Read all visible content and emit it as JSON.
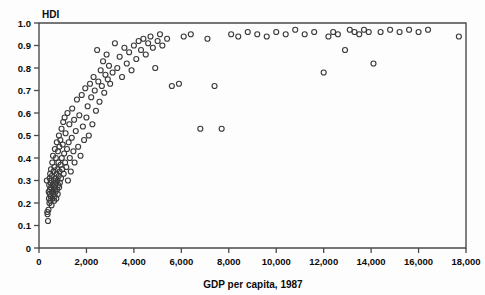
{
  "chart_data": {
    "type": "scatter",
    "title": "",
    "xlabel": "GDP per capita, 1987",
    "ylabel": "HDI",
    "xlim": [
      0,
      18000
    ],
    "ylim": [
      0,
      1.0
    ],
    "grid": false,
    "legend": null,
    "marker": "open-circle",
    "marker_color": "#3a3a3a",
    "xticks": [
      0,
      2000,
      4000,
      6000,
      8000,
      10000,
      12000,
      14000,
      16000,
      18000
    ],
    "xticklabels": [
      "0",
      "2,000",
      "4,000",
      "6,000",
      "8,000",
      "10,000",
      "12,000",
      "14,000",
      "16,000",
      "18,000"
    ],
    "yticks": [
      0,
      0.1,
      0.2,
      0.3,
      0.4,
      0.5,
      0.6,
      0.7,
      0.8,
      0.9,
      1.0
    ],
    "yticklabels": [
      "0",
      "0.1",
      "0.2",
      "0.3",
      "0.4",
      "0.5",
      "0.6",
      "0.7",
      "0.8",
      "0.9",
      "1.0"
    ],
    "series": [
      {
        "name": "countries",
        "x": [
          330,
          350,
          360,
          380,
          400,
          410,
          420,
          430,
          440,
          450,
          455,
          460,
          470,
          480,
          490,
          500,
          505,
          510,
          520,
          530,
          540,
          550,
          560,
          570,
          580,
          590,
          600,
          610,
          620,
          630,
          640,
          650,
          660,
          670,
          680,
          690,
          700,
          710,
          720,
          730,
          740,
          750,
          760,
          770,
          780,
          790,
          800,
          810,
          820,
          830,
          840,
          850,
          860,
          870,
          880,
          900,
          910,
          930,
          950,
          960,
          980,
          1000,
          1020,
          1040,
          1060,
          1080,
          1100,
          1120,
          1150,
          1180,
          1200,
          1220,
          1250,
          1280,
          1300,
          1340,
          1380,
          1400,
          1450,
          1480,
          1500,
          1550,
          1600,
          1650,
          1700,
          1750,
          1800,
          1850,
          1900,
          1950,
          2000,
          2050,
          2100,
          2150,
          2200,
          2250,
          2300,
          2350,
          2400,
          2450,
          2500,
          2550,
          2600,
          2650,
          2700,
          2750,
          2800,
          2850,
          2900,
          2950,
          3000,
          3100,
          3200,
          3300,
          3400,
          3500,
          3600,
          3700,
          3800,
          3900,
          4000,
          4100,
          4200,
          4300,
          4400,
          4500,
          4600,
          4700,
          4800,
          4900,
          5000,
          5100,
          5200,
          5400,
          5600,
          5900,
          6100,
          6400,
          6800,
          7100,
          7400,
          7700,
          8100,
          8400,
          8800,
          9200,
          9600,
          10000,
          10400,
          10800,
          11200,
          11600,
          12000,
          12200,
          12400,
          12600,
          12900,
          13100,
          13300,
          13500,
          13700,
          13900,
          14100,
          14400,
          14800,
          15200,
          15600,
          16000,
          16400,
          17700
        ],
        "y": [
          0.3,
          0.16,
          0.15,
          0.12,
          0.17,
          0.25,
          0.22,
          0.28,
          0.2,
          0.31,
          0.24,
          0.26,
          0.33,
          0.21,
          0.29,
          0.23,
          0.35,
          0.27,
          0.3,
          0.19,
          0.32,
          0.25,
          0.38,
          0.22,
          0.28,
          0.41,
          0.24,
          0.34,
          0.26,
          0.3,
          0.21,
          0.36,
          0.23,
          0.44,
          0.27,
          0.31,
          0.25,
          0.4,
          0.29,
          0.22,
          0.33,
          0.47,
          0.26,
          0.35,
          0.3,
          0.24,
          0.43,
          0.28,
          0.38,
          0.32,
          0.5,
          0.27,
          0.45,
          0.34,
          0.29,
          0.48,
          0.37,
          0.31,
          0.53,
          0.4,
          0.35,
          0.46,
          0.56,
          0.33,
          0.42,
          0.58,
          0.38,
          0.51,
          0.36,
          0.44,
          0.6,
          0.3,
          0.47,
          0.55,
          0.4,
          0.34,
          0.49,
          0.62,
          0.43,
          0.57,
          0.38,
          0.52,
          0.66,
          0.45,
          0.59,
          0.41,
          0.68,
          0.54,
          0.48,
          0.71,
          0.58,
          0.63,
          0.5,
          0.73,
          0.67,
          0.55,
          0.76,
          0.7,
          0.61,
          0.88,
          0.74,
          0.65,
          0.79,
          0.72,
          0.83,
          0.69,
          0.77,
          0.86,
          0.75,
          0.81,
          0.73,
          0.78,
          0.91,
          0.8,
          0.85,
          0.76,
          0.89,
          0.82,
          0.87,
          0.79,
          0.9,
          0.84,
          0.92,
          0.88,
          0.93,
          0.86,
          0.91,
          0.94,
          0.89,
          0.8,
          0.92,
          0.95,
          0.9,
          0.93,
          0.72,
          0.73,
          0.94,
          0.95,
          0.53,
          0.93,
          0.72,
          0.53,
          0.95,
          0.94,
          0.96,
          0.95,
          0.94,
          0.96,
          0.95,
          0.97,
          0.95,
          0.96,
          0.78,
          0.94,
          0.96,
          0.95,
          0.88,
          0.97,
          0.96,
          0.95,
          0.97,
          0.96,
          0.82,
          0.96,
          0.97,
          0.96,
          0.97,
          0.96,
          0.97,
          0.94
        ]
      }
    ]
  }
}
